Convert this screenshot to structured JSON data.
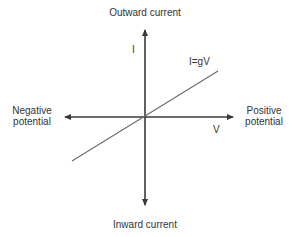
{
  "diagram": {
    "labels": {
      "top": "Outward current",
      "bottom": "Inward current",
      "left": "Negative\npotential",
      "left_line1": "Negative",
      "left_line2": "potential",
      "right_line1": "Positive",
      "right_line2": "potential",
      "y_axis": "I",
      "x_axis": "V",
      "line": "I=gV"
    },
    "colors": {
      "axis": "#3a3a3a",
      "line": "#6a6a6a",
      "text": "#333333"
    },
    "geometry": {
      "origin": [
        145,
        117
      ],
      "x_axis": [
        65,
        233
      ],
      "y_axis": [
        30,
        205
      ],
      "ohmic_line": [
        [
          72,
          161
        ],
        [
          218,
          71
        ]
      ]
    }
  }
}
